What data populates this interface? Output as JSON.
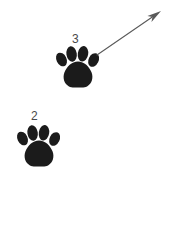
{
  "figure": {
    "kind": "paw-print-trail-diagram",
    "background_color": "#ffffff",
    "width": 191,
    "height": 246
  },
  "labels": {
    "upper_paw": "3",
    "lower_paw": "2",
    "label_color": "#4a4a4a"
  },
  "paws": [
    {
      "name": "upper-paw-print",
      "label": "3",
      "color": "#1b1b1b",
      "center_x": 78,
      "center_y": 68,
      "width": 41,
      "height": 42,
      "rotation_deg": 0,
      "toe_count": 4
    },
    {
      "name": "lower-paw-print",
      "label": "2",
      "color": "#1b1b1b",
      "center_x": 39,
      "center_y": 147,
      "width": 42,
      "height": 40,
      "rotation_deg": 0,
      "toe_count": 4
    }
  ],
  "arrow": {
    "name": "direction-arrow",
    "color": "#5a5a5a",
    "start_x": 97,
    "start_y": 55,
    "end_x": 161,
    "end_y": 11,
    "stroke_width": 1.1,
    "head_length": 14,
    "head_width": 7,
    "direction": "up-right"
  }
}
